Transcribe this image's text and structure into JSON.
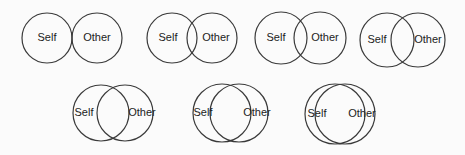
{
  "colors": {
    "stroke": "#3a3a3a",
    "text": "#222222",
    "background": "#fbfbfb"
  },
  "diagrams": [
    {
      "id": 1,
      "self_label": "Self",
      "other_label": "Other",
      "cy": 38,
      "r": 25,
      "self_cx": 47,
      "other_cx": 97,
      "self_tx": 47,
      "other_tx": 97
    },
    {
      "id": 2,
      "self_label": "Self",
      "other_label": "Other",
      "cy": 38,
      "r": 25,
      "self_cx": 172,
      "other_cx": 212,
      "self_tx": 168,
      "other_tx": 216
    },
    {
      "id": 3,
      "self_label": "Self",
      "other_label": "Other",
      "cy": 38,
      "r": 26,
      "self_cx": 281,
      "other_cx": 320,
      "self_tx": 276,
      "other_tx": 325
    },
    {
      "id": 4,
      "self_label": "Self",
      "other_label": "Other",
      "cy": 40,
      "r": 27,
      "self_cx": 387,
      "other_cx": 418,
      "self_tx": 377,
      "other_tx": 428
    },
    {
      "id": 5,
      "self_label": "Self",
      "other_label": "Other",
      "cy": 113,
      "r": 28,
      "self_cx": 101,
      "other_cx": 125,
      "self_tx": 84,
      "other_tx": 142
    },
    {
      "id": 6,
      "self_label": "Self",
      "other_label": "Other",
      "cy": 113,
      "r": 29,
      "self_cx": 222,
      "other_cx": 239,
      "self_tx": 203,
      "other_tx": 257
    },
    {
      "id": 7,
      "self_label": "Self",
      "other_label": "Other",
      "cy": 114,
      "r": 30,
      "self_cx": 335,
      "other_cx": 345,
      "self_tx": 317,
      "other_tx": 362
    }
  ]
}
